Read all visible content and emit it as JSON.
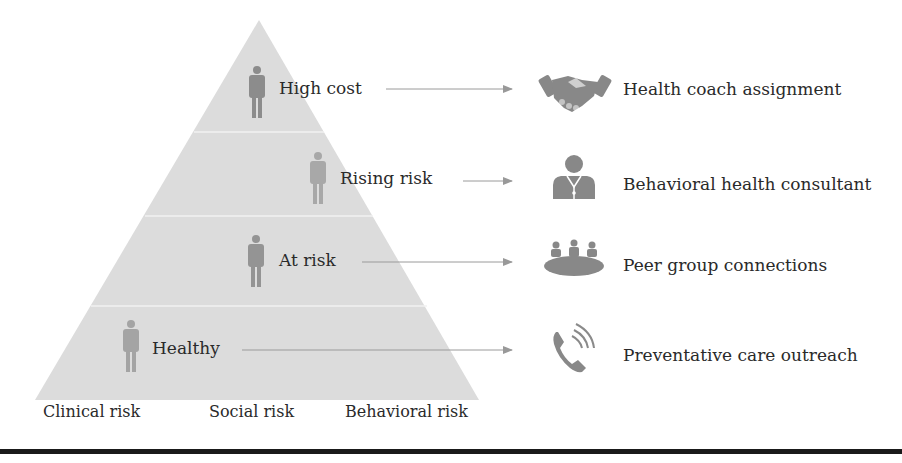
{
  "figure": {
    "pyramid": {
      "fill_color": "#dcdcdc",
      "divider_color": "#f4f4f4",
      "tiers": [
        {
          "label": "High cost",
          "intervention": "Health coach assignment",
          "icon": "handshake-icon"
        },
        {
          "label": "Rising risk",
          "intervention": "Behavioral health consultant",
          "icon": "consultant-doctor-icon"
        },
        {
          "label": "At risk",
          "intervention": "Peer group connections",
          "icon": "group-meeting-icon"
        },
        {
          "label": "Healthy",
          "intervention": "Preventative care outreach",
          "icon": "phone-call-icon"
        }
      ]
    },
    "axis_labels": [
      "Clinical risk",
      "Social risk",
      "Behavioral risk"
    ],
    "colors": {
      "icon": "#8a8a8a",
      "person": "#9a9a9a",
      "arrow": "#999999",
      "text": "#2a2a2a",
      "rule": "#1a1a1a"
    }
  }
}
